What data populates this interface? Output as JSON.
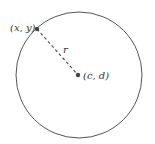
{
  "diagram": {
    "title": "",
    "circle": {
      "cx": 79,
      "cy": 75,
      "r": 63,
      "stroke": "#555555"
    },
    "point_on_circle": {
      "label": "(x, y)",
      "px": 37,
      "py": 29
    },
    "center": {
      "label": "(c, d)",
      "px": 78,
      "py": 75
    },
    "radius_label": "r",
    "colors": {
      "stroke": "#555555",
      "dot": "#444444"
    }
  }
}
